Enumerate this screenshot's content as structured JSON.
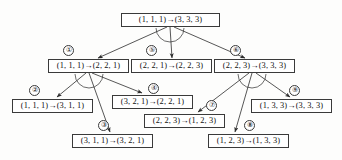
{
  "diagram": {
    "arrow_glyph": "→",
    "stroke_color": "#3a3a3a",
    "background_color": "#fdfdfc",
    "nodes": [
      {
        "id": "root",
        "label": "(1, 1, 1)→(3, 3, 3)",
        "marker": "",
        "x": 121,
        "y": 13,
        "w": 99
      },
      {
        "id": "n1",
        "label": "(1, 1, 1)→(2, 2, 1)",
        "marker": "①",
        "x": 48,
        "y": 59,
        "w": 81
      },
      {
        "id": "n5",
        "label": "(2, 2, 1)→(2, 2, 3)",
        "marker": "⑤",
        "x": 131,
        "y": 59,
        "w": 81
      },
      {
        "id": "n6",
        "label": "(2, 2, 3)→(3, 3, 3)",
        "marker": "⑥",
        "x": 214,
        "y": 59,
        "w": 81
      },
      {
        "id": "n2",
        "label": "(1, 1, 1)→(3, 1, 1)",
        "marker": "②",
        "x": 12,
        "y": 99,
        "w": 81
      },
      {
        "id": "n4",
        "label": "(3, 2, 1)→(2, 2, 1)",
        "marker": "④",
        "x": 112,
        "y": 95,
        "w": 81
      },
      {
        "id": "n9",
        "label": "(1, 3, 3)→(3, 3, 3)",
        "marker": "⑨",
        "x": 251,
        "y": 99,
        "w": 81
      },
      {
        "id": "n7",
        "label": "(2, 2, 3)→(1, 2, 3)",
        "marker": "⑦",
        "x": 144,
        "y": 114,
        "w": 81
      },
      {
        "id": "n3",
        "label": "(3, 1, 1)→(3, 2, 1)",
        "marker": "③",
        "x": 72,
        "y": 134,
        "w": 81
      },
      {
        "id": "n8",
        "label": "(1, 2, 3)→(1, 3, 3)",
        "marker": "⑧",
        "x": 208,
        "y": 134,
        "w": 81
      }
    ],
    "markers": [
      {
        "id": "m1",
        "text": "①",
        "x": 63,
        "y": 45
      },
      {
        "id": "m5",
        "text": "⑤",
        "x": 146,
        "y": 45
      },
      {
        "id": "m6",
        "text": "⑥",
        "x": 230,
        "y": 45
      },
      {
        "id": "m2",
        "text": "②",
        "x": 29,
        "y": 85
      },
      {
        "id": "m4",
        "text": "④",
        "x": 148,
        "y": 83
      },
      {
        "id": "m9",
        "text": "⑨",
        "x": 289,
        "y": 85
      },
      {
        "id": "m7",
        "text": "⑦",
        "x": 206,
        "y": 100
      },
      {
        "id": "m3",
        "text": "③",
        "x": 98,
        "y": 120
      },
      {
        "id": "m8",
        "text": "⑧",
        "x": 244,
        "y": 120
      }
    ],
    "edges": [
      {
        "from": "root",
        "to": "n1",
        "x1": 167,
        "y1": 27,
        "x2": 98,
        "y2": 58
      },
      {
        "from": "root",
        "to": "n5",
        "x1": 170,
        "y1": 27,
        "x2": 172,
        "y2": 58
      },
      {
        "from": "root",
        "to": "n6",
        "x1": 174,
        "y1": 27,
        "x2": 245,
        "y2": 58
      },
      {
        "from": "n1",
        "to": "n2",
        "x1": 86,
        "y1": 73,
        "x2": 57,
        "y2": 97
      },
      {
        "from": "n1",
        "to": "n3",
        "x1": 89,
        "y1": 73,
        "x2": 110,
        "y2": 132
      },
      {
        "from": "n1",
        "to": "n4",
        "x1": 92,
        "y1": 73,
        "x2": 142,
        "y2": 93
      },
      {
        "from": "n6",
        "to": "n7",
        "x1": 249,
        "y1": 73,
        "x2": 198,
        "y2": 112
      },
      {
        "from": "n6",
        "to": "n8",
        "x1": 252,
        "y1": 73,
        "x2": 235,
        "y2": 132
      },
      {
        "from": "n6",
        "to": "n9",
        "x1": 256,
        "y1": 73,
        "x2": 290,
        "y2": 97
      }
    ],
    "arcs": [
      {
        "at": "root",
        "cx": 170,
        "cy": 28,
        "r": 14
      },
      {
        "at": "n1",
        "cx": 89,
        "cy": 74,
        "r": 14
      },
      {
        "at": "n6",
        "cx": 252,
        "cy": 74,
        "r": 14
      }
    ]
  }
}
